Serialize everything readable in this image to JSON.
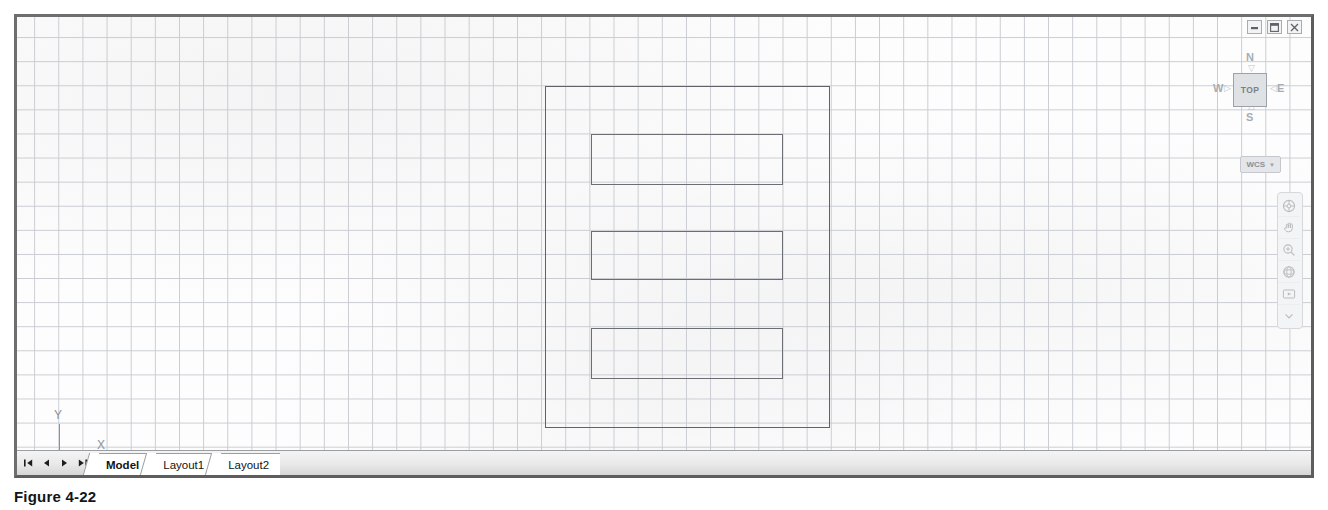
{
  "window": {
    "controls": [
      {
        "name": "minimize-button",
        "glyph": "minimize"
      },
      {
        "name": "restore-button",
        "glyph": "restore"
      },
      {
        "name": "close-button",
        "glyph": "close"
      }
    ]
  },
  "viewcube": {
    "face_label": "TOP",
    "compass": {
      "north": "N",
      "south": "S",
      "east": "E",
      "west": "W"
    }
  },
  "wcs": {
    "label": "WCS",
    "chevron": "▼"
  },
  "ucs": {
    "y_label": "Y",
    "x_label": "X"
  },
  "navbar": {
    "tools": [
      {
        "name": "steering-wheel-icon"
      },
      {
        "name": "pan-hand-icon"
      },
      {
        "name": "zoom-extents-icon"
      },
      {
        "name": "orbit-icon"
      },
      {
        "name": "showmotion-icon"
      },
      {
        "name": "nav-more-icon"
      }
    ]
  },
  "tabbar": {
    "nav_buttons": [
      {
        "name": "first-tab-button",
        "glyph": "first"
      },
      {
        "name": "previous-tab-button",
        "glyph": "prev"
      },
      {
        "name": "next-tab-button",
        "glyph": "next"
      },
      {
        "name": "last-tab-button",
        "glyph": "last"
      }
    ],
    "tabs": [
      {
        "label": "Model",
        "active": true
      },
      {
        "label": "Layout1",
        "active": false
      },
      {
        "label": "Layout2",
        "active": false
      }
    ]
  },
  "caption": {
    "text": "Figure 4-22"
  },
  "drawing": {
    "entities": [
      {
        "name": "outer-rectangle",
        "type": "rectangle"
      },
      {
        "name": "inner-rectangle-1",
        "type": "rectangle"
      },
      {
        "name": "inner-rectangle-2",
        "type": "rectangle"
      },
      {
        "name": "inner-rectangle-3",
        "type": "rectangle"
      }
    ],
    "grid_color": "#c9cdd2",
    "entity_color": "#6b6f74",
    "background_color": "#fdfdfd"
  }
}
